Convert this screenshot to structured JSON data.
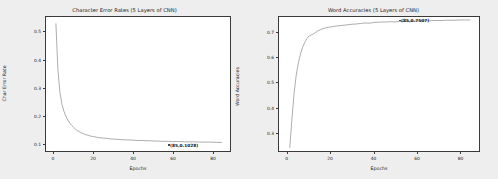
{
  "page": {
    "background_color": "#eeeeee",
    "panel_color": "#ffffff",
    "axis_color": "#3a3a3a",
    "line_color": "#8a8a8a"
  },
  "chart_data": [
    {
      "type": "line",
      "title": "Character Error Rates (5 Layers of CNN)",
      "xlabel": "Epochs",
      "ylabel": "Char Error Rate",
      "xlim": [
        -4,
        89
      ],
      "ylim": [
        0.072,
        0.555
      ],
      "xticks": [
        "0",
        "20",
        "40",
        "60",
        "80"
      ],
      "xtick_values": [
        0,
        20,
        40,
        60,
        80
      ],
      "yticks": [
        "0.1",
        "0.2",
        "0.3",
        "0.4",
        "0.5"
      ],
      "ytick_values": [
        0.1,
        0.2,
        0.3,
        0.4,
        0.5
      ],
      "grid": false,
      "legend": null,
      "annotation": {
        "text": "(85,0.1028)",
        "x": 85,
        "y": 0.1028
      },
      "series": [
        {
          "name": "Char Error Rate",
          "x": [
            1,
            2,
            3,
            4,
            5,
            6,
            7,
            8,
            9,
            10,
            11,
            12,
            13,
            14,
            15,
            16,
            17,
            18,
            19,
            20,
            22,
            24,
            26,
            28,
            30,
            32,
            34,
            36,
            38,
            40,
            42,
            44,
            46,
            48,
            50,
            52,
            54,
            56,
            58,
            60,
            62,
            64,
            66,
            68,
            70,
            72,
            74,
            76,
            78,
            80,
            82,
            84,
            85
          ],
          "values": [
            0.532,
            0.368,
            0.285,
            0.243,
            0.216,
            0.198,
            0.184,
            0.173,
            0.164,
            0.157,
            0.15,
            0.145,
            0.141,
            0.137,
            0.134,
            0.131,
            0.129,
            0.127,
            0.125,
            0.124,
            0.121,
            0.119,
            0.118,
            0.116,
            0.115,
            0.114,
            0.113,
            0.112,
            0.112,
            0.111,
            0.11,
            0.11,
            0.109,
            0.109,
            0.108,
            0.108,
            0.107,
            0.107,
            0.107,
            0.106,
            0.106,
            0.106,
            0.105,
            0.105,
            0.105,
            0.105,
            0.104,
            0.104,
            0.104,
            0.104,
            0.103,
            0.103,
            0.1028
          ]
        }
      ]
    },
    {
      "type": "line",
      "title": "Word Accuracies (5 Layers of CNN)",
      "xlabel": "Epochs",
      "ylabel": "Word Accuracies",
      "xlim": [
        -4,
        89
      ],
      "ylim": [
        0.225,
        0.762
      ],
      "xticks": [
        "0",
        "20",
        "40",
        "60",
        "80"
      ],
      "xtick_values": [
        0,
        20,
        40,
        60,
        80
      ],
      "yticks": [
        "0.3",
        "0.4",
        "0.5",
        "0.6",
        "0.7"
      ],
      "ytick_values": [
        0.3,
        0.4,
        0.5,
        0.6,
        0.7
      ],
      "grid": false,
      "legend": null,
      "annotation": {
        "text": "(85,0.7507)",
        "x": 85,
        "y": 0.7507
      },
      "series": [
        {
          "name": "Word Accuracies",
          "x": [
            1,
            2,
            3,
            4,
            5,
            6,
            7,
            8,
            9,
            10,
            11,
            12,
            13,
            14,
            15,
            16,
            17,
            18,
            19,
            20,
            22,
            24,
            26,
            28,
            30,
            32,
            34,
            36,
            38,
            40,
            42,
            44,
            46,
            48,
            50,
            52,
            54,
            56,
            58,
            60,
            62,
            64,
            66,
            68,
            70,
            72,
            74,
            76,
            78,
            80,
            82,
            84,
            85
          ],
          "values": [
            0.238,
            0.352,
            0.455,
            0.528,
            0.578,
            0.614,
            0.641,
            0.661,
            0.676,
            0.686,
            0.69,
            0.694,
            0.7,
            0.706,
            0.71,
            0.714,
            0.717,
            0.719,
            0.721,
            0.722,
            0.725,
            0.727,
            0.729,
            0.731,
            0.733,
            0.734,
            0.736,
            0.738,
            0.737,
            0.74,
            0.741,
            0.742,
            0.742,
            0.743,
            0.742,
            0.744,
            0.744,
            0.745,
            0.745,
            0.746,
            0.746,
            0.747,
            0.747,
            0.748,
            0.748,
            0.748,
            0.749,
            0.749,
            0.749,
            0.75,
            0.75,
            0.75,
            0.7507
          ]
        }
      ]
    }
  ]
}
